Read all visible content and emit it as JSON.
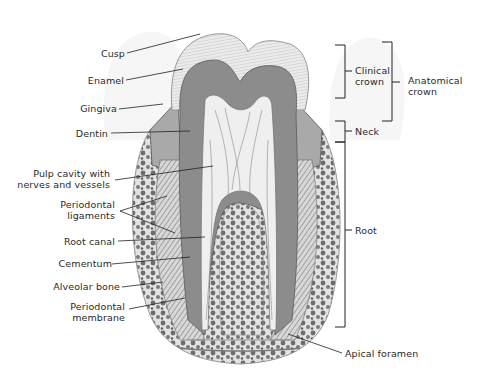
{
  "diagram": {
    "left_labels": [
      {
        "id": "cusp",
        "text": "Cusp"
      },
      {
        "id": "enamel",
        "text": "Enamel"
      },
      {
        "id": "gingiva",
        "text": "Gingiva"
      },
      {
        "id": "dentin",
        "text": "Dentin"
      },
      {
        "id": "pulp",
        "line1": "Pulp cavity with",
        "line2": "nerves and vessels"
      },
      {
        "id": "periodontal-ligaments",
        "line1": "Periodontal",
        "line2": "ligaments"
      },
      {
        "id": "root-canal",
        "text": "Root canal"
      },
      {
        "id": "cementum",
        "text": "Cementum"
      },
      {
        "id": "alveolar-bone",
        "text": "Alveolar bone"
      },
      {
        "id": "periodontal-membrane",
        "line1": "Periodontal",
        "line2": "membrane"
      }
    ],
    "right_labels": [
      {
        "id": "clinical-crown",
        "line1": "Clinical",
        "line2": "crown"
      },
      {
        "id": "anatomical-crown",
        "line1": "Anatomical",
        "line2": "crown"
      },
      {
        "id": "neck",
        "text": "Neck"
      },
      {
        "id": "root",
        "text": "Root"
      },
      {
        "id": "apical-foramen",
        "text": "Apical foramen"
      }
    ],
    "colors": {
      "enamel": "#e4e4e4",
      "dentin": "#8a8a8a",
      "pulp": "#eeeeee",
      "bone": "#6e6e6e",
      "gum": "#bdbdbd",
      "line": "#222222"
    }
  }
}
